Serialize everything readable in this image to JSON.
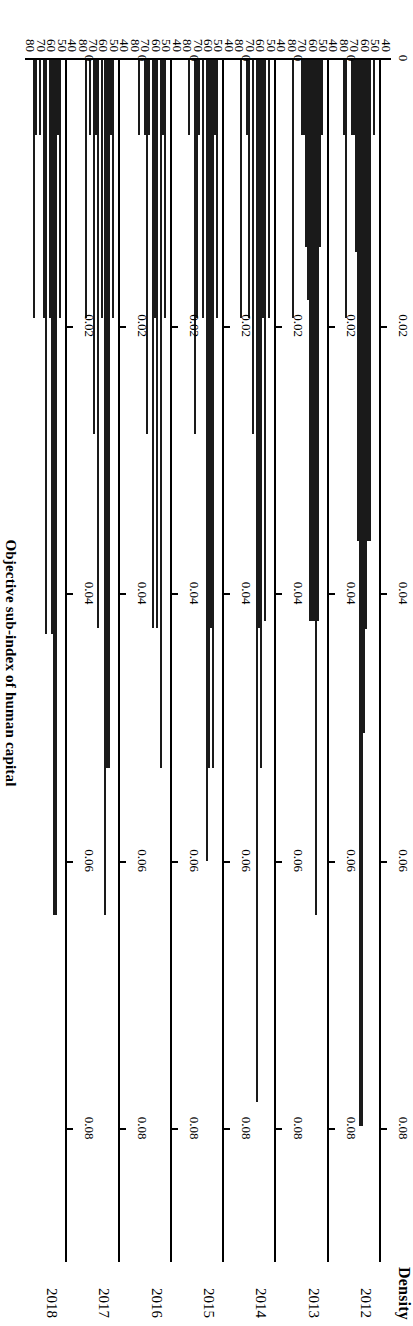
{
  "chart_data": {
    "type": "bar",
    "orientation": "horizontal",
    "title": "",
    "xlabel": "Density",
    "ylabel": "Objective sub-index of human capital",
    "xlim": [
      0,
      0.09
    ],
    "ylim": [
      35,
      85
    ],
    "grid": false,
    "legend": "none",
    "density_ticks": [
      {
        "value": 0,
        "label": "0"
      },
      {
        "value": 0.02,
        "label": "0.02"
      },
      {
        "value": 0.04,
        "label": "0.04"
      },
      {
        "value": 0.06,
        "label": "0.06"
      },
      {
        "value": 0.08,
        "label": "0.08"
      }
    ],
    "bin_ticks": [
      {
        "value": 40,
        "label": "40"
      },
      {
        "value": 50,
        "label": "50"
      },
      {
        "value": 60,
        "label": "60"
      },
      {
        "value": 70,
        "label": "70"
      },
      {
        "value": 80,
        "label": "80"
      }
    ],
    "bin_width": 2.5,
    "panels": [
      {
        "year": "2012",
        "bins": [
          37.5,
          40,
          42.5,
          45,
          47.5,
          50,
          52.5,
          55,
          57.5,
          60,
          62.5,
          65,
          67.5,
          70,
          72.5,
          75,
          77.5,
          80,
          82.5
        ],
        "values": [
          0.0,
          0.0056,
          0.0,
          0.036,
          0.036,
          0.0426,
          0.0504,
          0.0798,
          0.0798,
          0.036,
          0.0144,
          0.0056,
          0.0056,
          0.0,
          0.0,
          0.0193,
          0.0056,
          0.0,
          0.0
        ]
      },
      {
        "year": "2013",
        "bins": [
          37.5,
          40,
          42.5,
          45,
          47.5,
          50,
          52.5,
          55,
          57.5,
          60,
          62.5,
          65,
          67.5,
          70,
          72.5,
          75,
          77.5,
          80,
          82.5
        ],
        "values": [
          0.0,
          0.0056,
          0.014,
          0.042,
          0.064,
          0.042,
          0.042,
          0.042,
          0.018,
          0.014,
          0.0056,
          0.0056,
          0.0,
          0.0,
          0.0,
          0.0193,
          0.0,
          0.0,
          0.0
        ]
      },
      {
        "year": "2014",
        "bins": [
          37.5,
          40,
          42.5,
          45,
          47.5,
          50,
          52.5,
          55,
          57.5,
          60,
          62.5,
          65,
          67.5,
          70,
          72.5,
          75,
          77.5,
          80,
          82.5
        ],
        "values": [
          0.0,
          0.0193,
          0.0,
          0.042,
          0.0193,
          0.053,
          0.0425,
          0.078,
          0.0,
          0.028,
          0.0,
          0.0193,
          0.0056,
          0.0,
          0.0,
          0.0193,
          0.0,
          0.0,
          0.0
        ]
      },
      {
        "year": "2015",
        "bins": [
          37.5,
          40,
          42.5,
          45,
          47.5,
          50,
          52.5,
          55,
          57.5,
          60,
          62.5,
          65,
          67.5,
          70,
          72.5,
          75,
          77.5,
          80,
          82.5
        ],
        "values": [
          0.0,
          0.0193,
          0.0056,
          0.053,
          0.0425,
          0.053,
          0.06,
          0.0,
          0.0193,
          0.0,
          0.0056,
          0.0193,
          0.028,
          0.0,
          0.0,
          0.0056,
          0.0,
          0.0,
          0.0
        ]
      },
      {
        "year": "2016",
        "bins": [
          37.5,
          40,
          42.5,
          45,
          47.5,
          50,
          52.5,
          55,
          57.5,
          60,
          62.5,
          65,
          67.5,
          70,
          72.5,
          75,
          77.5,
          80,
          82.5
        ],
        "values": [
          0.0,
          0.0193,
          0.0056,
          0.053,
          0.0,
          0.0425,
          0.0193,
          0.0425,
          0.0,
          0.0056,
          0.028,
          0.0056,
          0.0,
          0.0,
          0.0056,
          0.0,
          0.0,
          0.0,
          0.0
        ]
      },
      {
        "year": "2017",
        "bins": [
          37.5,
          40,
          42.5,
          45,
          47.5,
          50,
          52.5,
          55,
          57.5,
          60,
          62.5,
          65,
          67.5,
          70,
          72.5,
          75,
          77.5,
          80,
          82.5
        ],
        "values": [
          0.0,
          0.0193,
          0.0056,
          0.053,
          0.053,
          0.064,
          0.0193,
          0.0,
          0.0425,
          0.0056,
          0.028,
          0.0,
          0.0056,
          0.0,
          0.0193,
          0.0,
          0.0,
          0.0,
          0.0
        ]
      },
      {
        "year": "2018",
        "bins": [
          37.5,
          40,
          42.5,
          45,
          47.5,
          50,
          52.5,
          55,
          57.5,
          60,
          62.5,
          65,
          67.5,
          70,
          72.5,
          75,
          77.5,
          80,
          82.5
        ],
        "values": [
          0.0,
          0.0193,
          0.0056,
          0.064,
          0.064,
          0.043,
          0.0193,
          0.0,
          0.043,
          0.0193,
          0.0,
          0.0056,
          0.0,
          0.0056,
          0.0193,
          0.0,
          0.0,
          0.0,
          0.0
        ]
      }
    ]
  }
}
